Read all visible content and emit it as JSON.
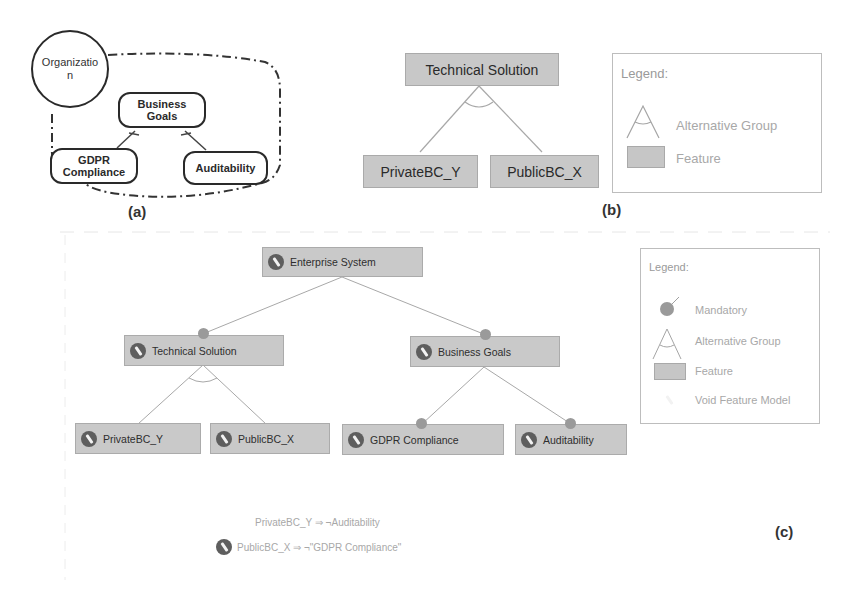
{
  "panel_a": {
    "label": "(a)",
    "actor": {
      "name": "Organizatio\nn",
      "line1": "Organizatio",
      "line2": "n"
    },
    "goals": [
      {
        "id": "business-goals",
        "line1": "Business",
        "line2": "Goals"
      },
      {
        "id": "gdpr-compliance",
        "line1": "GDPR",
        "line2": "Compliance"
      },
      {
        "id": "auditability",
        "line1": "Auditability",
        "line2": ""
      }
    ],
    "links": [
      {
        "from": "gdpr-compliance",
        "to": "business-goals",
        "type": "decomposition"
      },
      {
        "from": "auditability",
        "to": "business-goals",
        "type": "decomposition"
      }
    ]
  },
  "panel_b": {
    "label": "(b)",
    "root": "Technical Solution",
    "children": [
      "PrivateBC_Y",
      "PublicBC_X"
    ],
    "group_type": "Alternative Group",
    "legend": {
      "title": "Legend:",
      "items": [
        {
          "icon": "alternative-group-icon",
          "label": "Alternative Group"
        },
        {
          "icon": "feature-swatch",
          "label": "Feature"
        }
      ]
    }
  },
  "panel_c": {
    "label": "(c)",
    "root": "Enterprise System",
    "level1": [
      {
        "name": "Technical Solution",
        "relation": "mandatory"
      },
      {
        "name": "Business Goals",
        "relation": "mandatory"
      }
    ],
    "level2": [
      {
        "name": "PrivateBC_Y",
        "parent": "Technical Solution",
        "relation": "alternative"
      },
      {
        "name": "PublicBC_X",
        "parent": "Technical Solution",
        "relation": "alternative"
      },
      {
        "name": "GDPR Compliance",
        "parent": "Business Goals",
        "relation": "mandatory"
      },
      {
        "name": "Auditability",
        "parent": "Business Goals",
        "relation": "mandatory"
      }
    ],
    "constraints": [
      {
        "text": "PrivateBC_Y ⇒ ¬Auditability",
        "void": false
      },
      {
        "text": "PublicBC_X ⇒ ¬\"GDPR Compliance\"",
        "void": true
      }
    ],
    "legend": {
      "title": "Legend:",
      "items": [
        {
          "icon": "mandatory-icon",
          "label": "Mandatory"
        },
        {
          "icon": "alternative-group-icon",
          "label": "Alternative Group"
        },
        {
          "icon": "feature-swatch",
          "label": "Feature"
        },
        {
          "icon": "void-feature-model-icon",
          "label": "Void Feature Model"
        }
      ]
    }
  },
  "colors": {
    "feature_fill": "#c9c9c9",
    "feature_border": "#ababab",
    "edge": "#a0a0a0",
    "mandatory_dot": "#9a9a9a",
    "void_icon": "#5e5e5e",
    "legend_text": "#a8a8a8",
    "goal_stroke": "#2a2a2a"
  }
}
